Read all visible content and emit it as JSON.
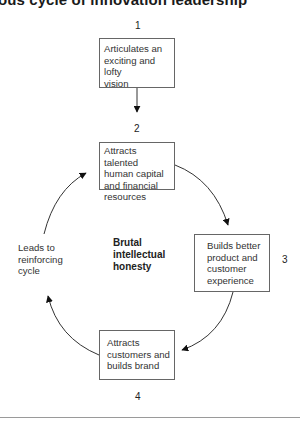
{
  "title": "ous cycle of innovation leadership",
  "steps": [
    {
      "number": "1",
      "lines": [
        "Articulates an",
        "exciting and lofty",
        "vision"
      ]
    },
    {
      "number": "2",
      "lines": [
        "Attracts talented",
        "human capital",
        "and financial",
        "resources"
      ]
    },
    {
      "number": "3",
      "lines": [
        "Builds better",
        "product and",
        "customer",
        "experience"
      ]
    },
    {
      "number": "4",
      "lines": [
        "Attracts",
        "customers and",
        "builds brand"
      ]
    }
  ],
  "side_label": {
    "lines": [
      "Leads to",
      "reinforcing",
      "cycle"
    ]
  },
  "center_label": {
    "lines": [
      "Brutal",
      "intellectual",
      "honesty"
    ]
  },
  "colors": {
    "box_border": "#666666",
    "arrow": "#333333",
    "text": "#333333"
  }
}
